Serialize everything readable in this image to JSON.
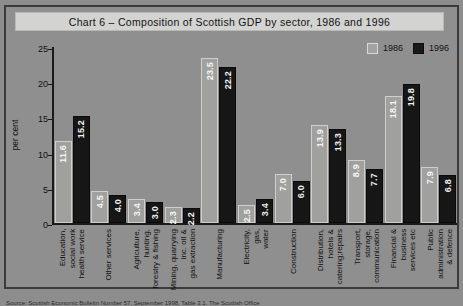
{
  "chart_data": {
    "type": "bar",
    "title": "Chart 6 – Composition of Scottish GDP by sector, 1986 and 1996",
    "xlabel": "",
    "ylabel": "per cent",
    "ylim": [
      0,
      25
    ],
    "yticks": [
      "0",
      "5",
      "10",
      "15",
      "20",
      "25"
    ],
    "grid": false,
    "legend_position": "top-right",
    "categories": [
      "Education,\nsocial work\nhealth service",
      "Other services",
      "Agriculture,\nhunting,\nforestry & fishing",
      "Mining, quarrying\ninc. oil &\ngas extraction",
      "Manufacturing",
      "Electricity,\ngas,\nwater",
      "Construction",
      "Distribution,\nhotels &\ncatering;repairs",
      "Transport,\nstorage,\ncommunication",
      "Financial &\nbusiness\nservices etc",
      "Public\nadministration\n& defence"
    ],
    "series": [
      {
        "name": "1986",
        "color": "#a0a09e",
        "values": [
          11.6,
          4.5,
          3.4,
          2.3,
          23.5,
          2.5,
          7.0,
          13.9,
          8.9,
          18.1,
          7.9
        ],
        "labels": [
          "11.6",
          "4.5",
          "3.4",
          "2.3",
          "23.5",
          "2.5",
          "7.0",
          "13.9",
          "8.9",
          "18.1",
          "7.9"
        ]
      },
      {
        "name": "1996",
        "color": "#161616",
        "values": [
          15.2,
          4.0,
          3.0,
          2.2,
          22.2,
          3.4,
          6.0,
          13.3,
          7.7,
          19.8,
          6.8
        ],
        "labels": [
          "15.2",
          "4.0",
          "3.0",
          "2.2",
          "22.2",
          "3.4",
          "6.0",
          "13.3",
          "7.7",
          "19.8",
          "6.8"
        ]
      }
    ]
  },
  "legend": {
    "items": [
      {
        "label": "1986"
      },
      {
        "label": "1996"
      }
    ]
  },
  "footnote": {
    "source": "Source: Scottish Economic Bulletin Number 57, September 1998, Table 3.1, The Scottish Office"
  }
}
